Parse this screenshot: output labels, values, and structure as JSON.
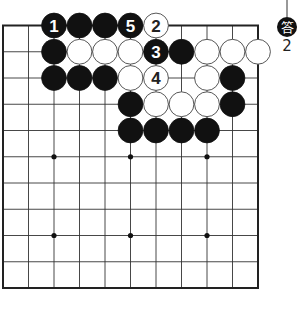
{
  "board": {
    "columns": 11,
    "rows": 10,
    "star_points": [
      [
        2,
        5
      ],
      [
        5,
        5
      ],
      [
        8,
        5
      ],
      [
        2,
        8
      ],
      [
        5,
        8
      ],
      [
        8,
        8
      ]
    ],
    "stones": [
      {
        "col": 2,
        "row": 0,
        "color": "black",
        "label": "1"
      },
      {
        "col": 3,
        "row": 0,
        "color": "black",
        "label": ""
      },
      {
        "col": 4,
        "row": 0,
        "color": "black",
        "label": ""
      },
      {
        "col": 5,
        "row": 0,
        "color": "black",
        "label": "5"
      },
      {
        "col": 6,
        "row": 0,
        "color": "white",
        "label": "2"
      },
      {
        "col": 2,
        "row": 1,
        "color": "black",
        "label": ""
      },
      {
        "col": 3,
        "row": 1,
        "color": "white",
        "label": ""
      },
      {
        "col": 4,
        "row": 1,
        "color": "white",
        "label": ""
      },
      {
        "col": 5,
        "row": 1,
        "color": "white",
        "label": ""
      },
      {
        "col": 6,
        "row": 1,
        "color": "black",
        "label": "3"
      },
      {
        "col": 7,
        "row": 1,
        "color": "black",
        "label": ""
      },
      {
        "col": 8,
        "row": 1,
        "color": "white",
        "label": ""
      },
      {
        "col": 9,
        "row": 1,
        "color": "white",
        "label": ""
      },
      {
        "col": 10,
        "row": 1,
        "color": "white",
        "label": ""
      },
      {
        "col": 2,
        "row": 2,
        "color": "black",
        "label": ""
      },
      {
        "col": 3,
        "row": 2,
        "color": "black",
        "label": ""
      },
      {
        "col": 4,
        "row": 2,
        "color": "black",
        "label": ""
      },
      {
        "col": 5,
        "row": 2,
        "color": "white",
        "label": ""
      },
      {
        "col": 6,
        "row": 2,
        "color": "white",
        "label": "4"
      },
      {
        "col": 8,
        "row": 2,
        "color": "white",
        "label": ""
      },
      {
        "col": 9,
        "row": 2,
        "color": "black",
        "label": ""
      },
      {
        "col": 5,
        "row": 3,
        "color": "black",
        "label": ""
      },
      {
        "col": 6,
        "row": 3,
        "color": "white",
        "label": ""
      },
      {
        "col": 7,
        "row": 3,
        "color": "white",
        "label": ""
      },
      {
        "col": 8,
        "row": 3,
        "color": "white",
        "label": ""
      },
      {
        "col": 9,
        "row": 3,
        "color": "black",
        "label": ""
      },
      {
        "col": 5,
        "row": 4,
        "color": "black",
        "label": ""
      },
      {
        "col": 6,
        "row": 4,
        "color": "black",
        "label": ""
      },
      {
        "col": 7,
        "row": 4,
        "color": "black",
        "label": ""
      },
      {
        "col": 8,
        "row": 4,
        "color": "black",
        "label": ""
      }
    ]
  },
  "answer": {
    "badge": "答",
    "number": "2"
  },
  "colors": {
    "line": "#333333",
    "black_stone": "#111111",
    "white_stone": "#ffffff",
    "background": "#ffffff"
  }
}
